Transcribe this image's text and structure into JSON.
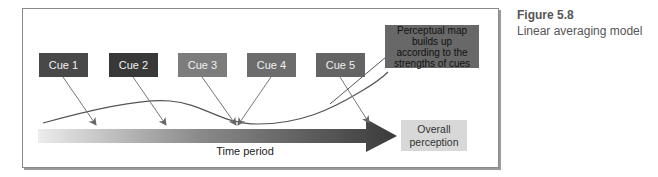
{
  "figure": {
    "number": "Figure 5.8",
    "caption": "Linear averaging model"
  },
  "diagram": {
    "cues": [
      {
        "label": "Cue 1",
        "color": "#484848"
      },
      {
        "label": "Cue 2",
        "color": "#383838"
      },
      {
        "label": "Cue 3",
        "color": "#7c7c7c"
      },
      {
        "label": "Cue 4",
        "color": "#6c6c6c"
      },
      {
        "label": "Cue 5",
        "color": "#646464"
      }
    ],
    "perceptual_map_note": "Perceptual map builds up according to the strengths of cues",
    "perceptual_map_lines": [
      "Perceptual map",
      "builds up",
      "according to the",
      "strengths of cues"
    ],
    "time_axis_label": "Time period",
    "outcome_label_lines": [
      "Overall",
      "perception"
    ],
    "colors": {
      "arrow_start": "#e6e6e6",
      "arrow_end": "#3a3a3a",
      "line": "#555555",
      "note_box": "#686868",
      "outcome_box": "#d8d8d8"
    }
  }
}
